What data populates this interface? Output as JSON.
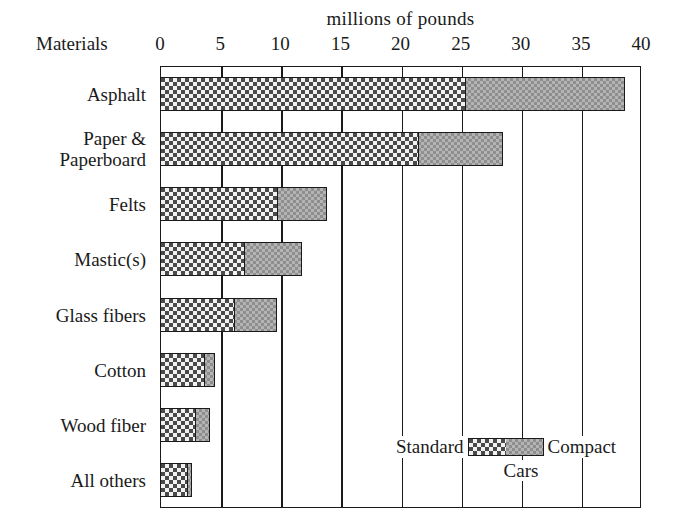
{
  "chart_data": {
    "type": "bar",
    "orientation": "horizontal",
    "stacked": true,
    "title": "millions of pounds",
    "xlabel": "millions of pounds",
    "ylabel": "Materials",
    "xlim": [
      0,
      40
    ],
    "xticks": [
      0,
      5,
      10,
      15,
      20,
      25,
      30,
      35,
      40
    ],
    "xtick_labels": [
      "0",
      "5",
      "10",
      "15",
      "20",
      "25",
      "30",
      "35",
      "40"
    ],
    "grid": true,
    "legend_title": "Cars",
    "legend_position": "inside-bottom-right",
    "categories": [
      "Asphalt",
      "Paper & Paperboard",
      "Felts",
      "Mastic(s)",
      "Glass fibers",
      "Cotton",
      "Wood fiber",
      "All others"
    ],
    "series": [
      {
        "name": "Standard",
        "color": "#4a4a4a",
        "pattern": "dark-checker",
        "values": [
          25.3,
          21.4,
          9.7,
          6.9,
          6.1,
          3.6,
          2.9,
          2.2
        ]
      },
      {
        "name": "Compact",
        "color": "#b4b4b4",
        "pattern": "light-checker",
        "values": [
          13.4,
          7.1,
          4.2,
          4.9,
          3.6,
          1.0,
          1.3,
          0.5
        ]
      }
    ],
    "totals": [
      38.7,
      28.5,
      13.9,
      11.8,
      9.7,
      4.6,
      4.2,
      2.7
    ]
  },
  "axis": {
    "materials_label": "Materials"
  },
  "legend": {
    "standard_label": "Standard",
    "compact_label": "Compact",
    "cars_label": "Cars"
  }
}
